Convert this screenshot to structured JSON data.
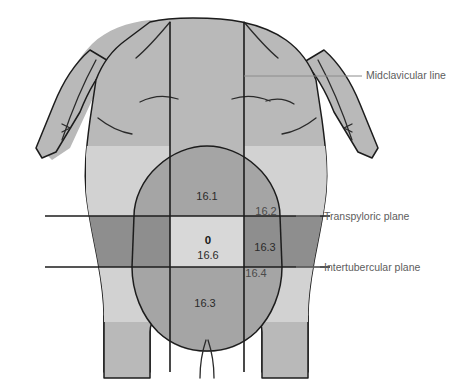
{
  "figure": {
    "background_color": "#ffffff"
  },
  "colors": {
    "body_fill": "#b9b9b9",
    "region_mid": "#a5a5a5",
    "region_dark": "#8e8e8e",
    "region_light": "#d2d2d2",
    "region_center": "#d8d8d8",
    "outline": "#1c1c1c",
    "callout": "#8c8c8c",
    "label_text": "#2b2b2b"
  },
  "callouts": [
    {
      "id": "midclavicular-line",
      "label": "Midclavicular line",
      "text_x": 366,
      "text_y": 75
    },
    {
      "id": "transpyloric-plane",
      "label": "Transpyloric plane",
      "text_x": 324,
      "text_y": 220
    },
    {
      "id": "intertubercular-plane",
      "label": "Intertubercular plane",
      "text_x": 324,
      "text_y": 270
    }
  ],
  "regions": [
    {
      "id": "epigastric",
      "value": "16.1",
      "x": 207,
      "y": 196,
      "shade": "mid",
      "bold": false
    },
    {
      "id": "right-hypochondriac",
      "value": "16.2",
      "x": 266,
      "y": 212,
      "shade": "light",
      "bold": false
    },
    {
      "id": "umbilical-marker",
      "value": "0",
      "x": 208,
      "y": 241,
      "shade": "center",
      "bold": true
    },
    {
      "id": "umbilical",
      "value": "16.6",
      "x": 208,
      "y": 255,
      "shade": "center",
      "bold": false
    },
    {
      "id": "right-lumbar",
      "value": "16.3",
      "x": 265,
      "y": 247,
      "shade": "dark",
      "bold": false
    },
    {
      "id": "right-inguinal",
      "value": "16.4",
      "x": 256,
      "y": 274,
      "shade": "light",
      "bold": false
    },
    {
      "id": "hypogastric",
      "value": "16.3",
      "x": 205,
      "y": 303,
      "shade": "mid",
      "bold": false
    }
  ],
  "planes": {
    "transpyloric": {
      "y": 216,
      "x_start": 45,
      "x_end": 330
    },
    "intertubercular": {
      "y": 267,
      "x_start": 45,
      "x_end": 330
    }
  },
  "midclavicular_lines": {
    "left": {
      "x": 170,
      "y_start": 22,
      "y_end": 372
    },
    "right": {
      "x": 244,
      "y_start": 22,
      "y_end": 372
    }
  }
}
